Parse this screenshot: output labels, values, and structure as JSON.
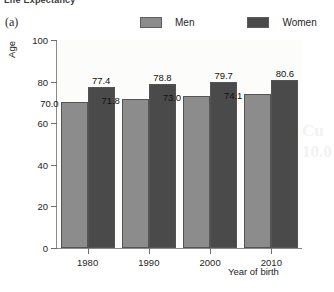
{
  "figure": {
    "cut_off_title": "Life Expectancy",
    "panel_label": "(a)"
  },
  "legend": {
    "items": [
      {
        "label": "Men",
        "color": "#8c8c8c"
      },
      {
        "label": "Women",
        "color": "#4a4a4a"
      }
    ]
  },
  "chart_data": {
    "type": "bar",
    "title": "Life Expectancy",
    "xlabel": "Year of birth",
    "ylabel": "Age",
    "categories": [
      "1980",
      "1990",
      "2000",
      "2010"
    ],
    "series": [
      {
        "name": "Men",
        "color": "#8c8c8c",
        "values": [
          70.0,
          71.8,
          73.0,
          74.1
        ]
      },
      {
        "name": "Women",
        "color": "#4a4a4a",
        "values": [
          77.4,
          78.8,
          79.7,
          80.6
        ]
      }
    ],
    "value_labels": {
      "Men": [
        "70.0",
        "71.8",
        "73.0",
        "74.1"
      ],
      "Women": [
        "77.4",
        "78.8",
        "79.7",
        "80.6"
      ]
    },
    "ylim": [
      0,
      100
    ],
    "yticks": [
      0,
      20,
      40,
      60,
      80,
      100
    ],
    "ytick_labels": [
      "0",
      "20",
      "40",
      "60",
      "80",
      "100"
    ],
    "grid": false,
    "legend_position": "top"
  },
  "axes": {
    "y_title": "Age",
    "x_title": "Year of birth"
  }
}
